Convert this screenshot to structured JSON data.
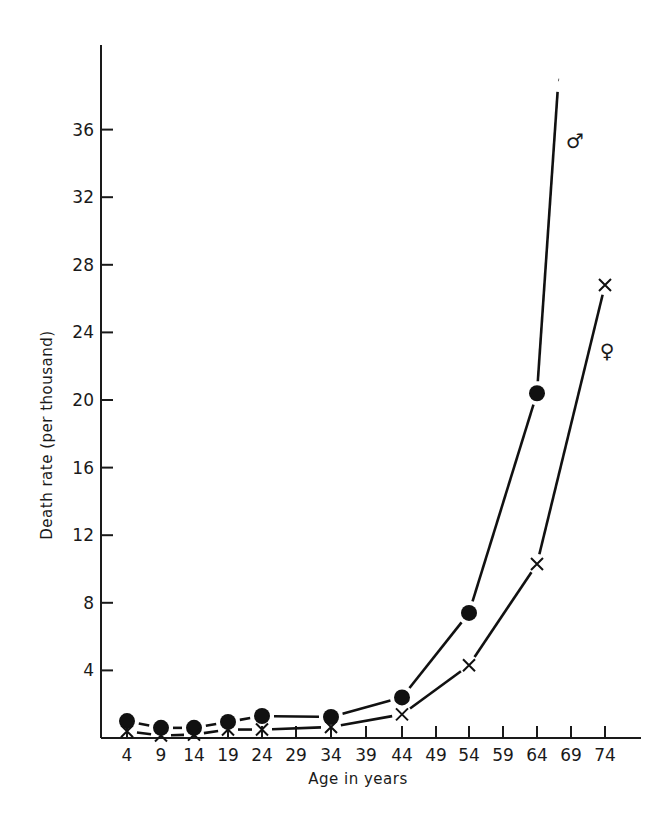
{
  "chart_data": {
    "type": "line",
    "title": "",
    "xlabel": "Age in years",
    "ylabel": "Death rate (per thousand)",
    "x": [
      4,
      9,
      14,
      19,
      24,
      34,
      44,
      54,
      64
    ],
    "x_ticks": [
      4,
      9,
      14,
      19,
      24,
      29,
      34,
      39,
      44,
      49,
      54,
      59,
      64,
      69,
      74
    ],
    "y_ticks": [
      4,
      8,
      12,
      16,
      20,
      24,
      28,
      32,
      36
    ],
    "ylim": [
      0,
      40
    ],
    "xlim": [
      0,
      80
    ],
    "grid": false,
    "legend_position": "inline labels near line ends",
    "series": [
      {
        "name": "Male",
        "label_symbol": "♂",
        "marker": "filled-circle",
        "x": [
          4,
          9,
          14,
          19,
          24,
          34,
          44,
          54,
          64
        ],
        "values": [
          1.0,
          0.6,
          0.6,
          0.95,
          1.3,
          1.25,
          2.4,
          7.4,
          20.4
        ],
        "continues_above_to": {
          "x": 67,
          "y": 39
        }
      },
      {
        "name": "Female",
        "label_symbol": "♀",
        "marker": "x",
        "x": [
          4,
          9,
          14,
          19,
          24,
          34,
          44,
          54,
          64,
          74
        ],
        "values": [
          0.4,
          0.15,
          0.2,
          0.5,
          0.5,
          0.65,
          1.4,
          4.3,
          10.3,
          26.8
        ]
      }
    ]
  }
}
